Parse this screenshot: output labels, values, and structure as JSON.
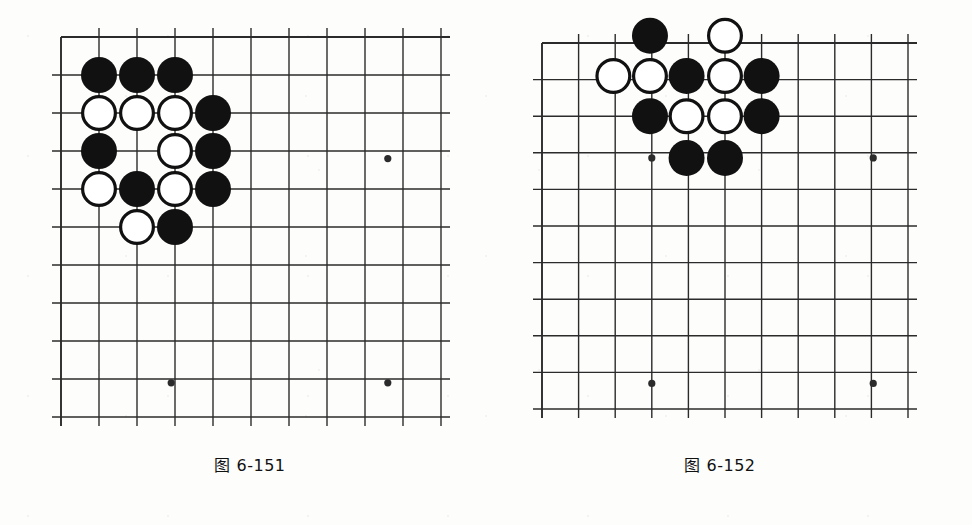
{
  "page": {
    "background_color": "#fdfdfc",
    "line_color": "#2b2b2b",
    "black_stone_color": "#111111",
    "white_stone_fill": "#ffffff",
    "white_stone_border": "#111111"
  },
  "figures": [
    {
      "id": "figure-left",
      "caption": "图 6-151",
      "board": {
        "origin_x": 61,
        "origin_y": 37,
        "spacing": 38,
        "cols": 11,
        "rows": 11,
        "edges": {
          "top": true,
          "left": true,
          "right": false,
          "bottom": false
        },
        "star_points": [
          {
            "col": 8.6,
            "row": 3.2
          },
          {
            "col": 2.9,
            "row": 9.1
          },
          {
            "col": 8.6,
            "row": 9.1
          }
        ],
        "stone_radius": 18,
        "stones": [
          {
            "color": "black",
            "col": 1,
            "row": 1
          },
          {
            "color": "black",
            "col": 2,
            "row": 1
          },
          {
            "color": "black",
            "col": 3,
            "row": 1
          },
          {
            "color": "white",
            "col": 1,
            "row": 2
          },
          {
            "color": "white",
            "col": 2,
            "row": 2
          },
          {
            "color": "white",
            "col": 3,
            "row": 2
          },
          {
            "color": "black",
            "col": 4,
            "row": 2
          },
          {
            "color": "black",
            "col": 1,
            "row": 3
          },
          {
            "color": "white",
            "col": 3,
            "row": 3
          },
          {
            "color": "black",
            "col": 4,
            "row": 3
          },
          {
            "color": "white",
            "col": 1,
            "row": 4
          },
          {
            "color": "black",
            "col": 2,
            "row": 4
          },
          {
            "color": "white",
            "col": 3,
            "row": 4
          },
          {
            "color": "black",
            "col": 4,
            "row": 4
          },
          {
            "color": "white",
            "col": 2,
            "row": 5
          },
          {
            "color": "black",
            "col": 3,
            "row": 5
          }
        ]
      },
      "layout": {
        "x": 46,
        "y": 22,
        "w": 410,
        "h": 410,
        "caption_x": 60,
        "caption_y": 452,
        "caption_w": 380
      }
    },
    {
      "id": "figure-right",
      "caption": "图 6-152",
      "board": {
        "origin_x": 542,
        "origin_y": 43,
        "spacing": 36.6,
        "cols": 11,
        "rows": 11,
        "edges": {
          "top": true,
          "left": true,
          "right": false,
          "bottom": false
        },
        "star_points": [
          {
            "col": 3.0,
            "row": 3.14
          },
          {
            "col": 9.05,
            "row": 3.14
          },
          {
            "col": 3.0,
            "row": 9.3
          },
          {
            "col": 9.05,
            "row": 9.3
          }
        ],
        "stone_radius": 18,
        "stones": [
          {
            "color": "black",
            "col": 2.95,
            "row": -0.2
          },
          {
            "color": "white",
            "col": 5.0,
            "row": -0.2
          },
          {
            "color": "white",
            "col": 1.95,
            "row": 0.9
          },
          {
            "color": "white",
            "col": 2.95,
            "row": 0.9
          },
          {
            "color": "black",
            "col": 3.95,
            "row": 0.9
          },
          {
            "color": "white",
            "col": 5.0,
            "row": 0.9
          },
          {
            "color": "black",
            "col": 6.0,
            "row": 0.9
          },
          {
            "color": "black",
            "col": 2.95,
            "row": 2.0
          },
          {
            "color": "white",
            "col": 3.95,
            "row": 2.0
          },
          {
            "color": "white",
            "col": 5.0,
            "row": 2.0
          },
          {
            "color": "black",
            "col": 6.0,
            "row": 2.0
          },
          {
            "color": "black",
            "col": 3.95,
            "row": 3.14
          },
          {
            "color": "black",
            "col": 5.0,
            "row": 3.14
          }
        ]
      },
      "layout": {
        "x": 524,
        "y": 22,
        "w": 410,
        "h": 410,
        "caption_x": 530,
        "caption_y": 452,
        "caption_w": 380
      }
    }
  ]
}
